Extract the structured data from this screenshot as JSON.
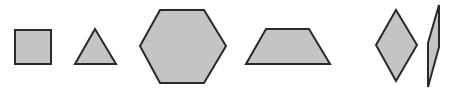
{
  "colors": {
    "background": "#ffffff",
    "fill": "#c4c4c4",
    "stroke": "#2a2a2a"
  },
  "stroke_width": 2,
  "shapes": [
    {
      "name": "square",
      "points": "15,30 51,30 51,64 15,64"
    },
    {
      "name": "triangle",
      "points": "95,29 116,64 75,64"
    },
    {
      "name": "hexagon",
      "points": "140,46 160,10 204,10 226,46 204,83 160,83"
    },
    {
      "name": "trapezoid",
      "points": "246,64 266,29 309,29 330,64"
    },
    {
      "name": "rhombus",
      "points": "376,45 396,10 417,45 396,81"
    },
    {
      "name": "parallelogram",
      "points": "439,5 439,47 428,87 428,43"
    }
  ]
}
